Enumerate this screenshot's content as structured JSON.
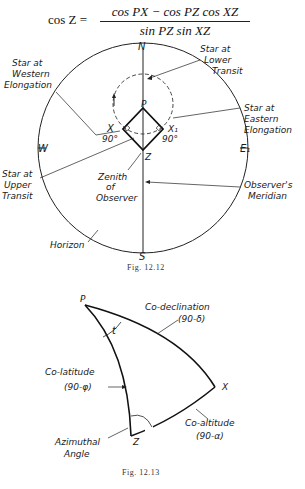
{
  "formula": {
    "lhs": "cos Z =",
    "numerator": "cos PX − cos PZ cos XZ",
    "denominator": "sin PZ sin XZ"
  },
  "figure_12_12": {
    "caption": "Fig. 12.12",
    "cardinal": {
      "north": "N",
      "south": "S",
      "west": "W",
      "east": "E₁"
    },
    "points": {
      "pole": "P",
      "zenith": "Z",
      "star_west": "X",
      "star_east": "X₁"
    },
    "angles": {
      "left": "90°",
      "right": "90°"
    },
    "labels": {
      "lower_transit": [
        "Star at",
        "Lower",
        "Transit"
      ],
      "western_elongation": [
        "Star at",
        "Western",
        "Elongation"
      ],
      "eastern_elongation": [
        "Star at",
        "Eastern",
        "Elongation"
      ],
      "upper_transit": [
        "Star at",
        "Upper",
        "Transit"
      ],
      "zenith": [
        "Zenith",
        "of",
        "Observer"
      ],
      "meridian": [
        "Observer's",
        "Meridian"
      ],
      "horizon": "Horizon"
    }
  },
  "figure_12_13": {
    "caption": "Fig. 12.13",
    "points": {
      "pole": "P",
      "star": "X",
      "zenith": "Z"
    },
    "angle_t": "t",
    "labels": {
      "co_declination": [
        "Co-declination",
        "(90-δ)"
      ],
      "co_latitude": [
        "Co-latitude",
        "(90-φ)"
      ],
      "co_altitude": [
        "Co-altitude",
        "(90-α)"
      ],
      "azimuthal": [
        "Azimuthal",
        "Angle"
      ]
    }
  }
}
